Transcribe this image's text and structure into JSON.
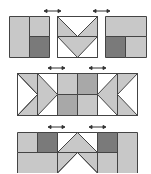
{
  "colors": {
    "light": "#c8c8c8",
    "dark": "#7a7a7a",
    "white": "#ffffff",
    "stroke": "#444444",
    "arrow": "#333333"
  },
  "rows": [
    {
      "name": "top-row",
      "blocks": 3,
      "description": "Three blocks with joining arrows"
    },
    {
      "name": "middle-row",
      "columns": 6,
      "description": "Flying geese and four-patch sewn row"
    },
    {
      "name": "bottom-row",
      "columns": 6,
      "description": "Assembled row with V units"
    }
  ],
  "arrows": [
    {
      "row": "top",
      "count": 2
    },
    {
      "row": "middle",
      "count": 2
    },
    {
      "row": "bottom",
      "count": 2
    }
  ]
}
